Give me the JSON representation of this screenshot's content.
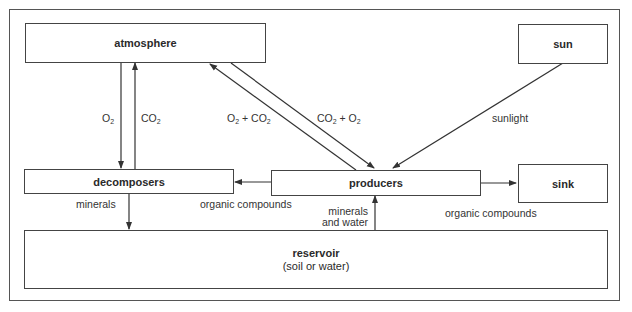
{
  "nodes": {
    "atmosphere": {
      "label": "atmosphere"
    },
    "sun": {
      "label": "sun"
    },
    "decomposers": {
      "label": "decomposers"
    },
    "producers": {
      "label": "producers"
    },
    "sink": {
      "label": "sink"
    },
    "reservoir": {
      "label": "reservoir",
      "sublabel": "(soil or water)"
    }
  },
  "edges": [
    {
      "from": "atmosphere",
      "to": "decomposers",
      "label_main": "O",
      "label_sub": "2"
    },
    {
      "from": "decomposers",
      "to": "atmosphere",
      "label_main": "CO",
      "label_sub": "2"
    },
    {
      "from": "producers",
      "to": "atmosphere",
      "label": "O2 + CO2"
    },
    {
      "from": "atmosphere",
      "to": "producers",
      "label": "CO2 + O2"
    },
    {
      "from": "sun",
      "to": "producers",
      "label": "sunlight"
    },
    {
      "from": "producers",
      "to": "decomposers",
      "label": "organic compounds"
    },
    {
      "from": "producers",
      "to": "sink",
      "label": "organic compounds"
    },
    {
      "from": "decomposers",
      "to": "reservoir",
      "label": "minerals"
    },
    {
      "from": "reservoir",
      "to": "producers",
      "label_line1": "minerals",
      "label_line2": "and water"
    }
  ],
  "labels": {
    "o2": {
      "a": "O",
      "b": "2"
    },
    "co2": {
      "a": "CO",
      "b": "2"
    },
    "o2_co2": {
      "a": "O",
      "b": "2",
      "c": " + CO",
      "d": "2"
    },
    "co2_o2": {
      "a": "CO",
      "b": "2",
      "c": " + O",
      "d": "2"
    },
    "sunlight": "sunlight",
    "organic_left": "organic compounds",
    "organic_right": "organic compounds",
    "minerals": "minerals",
    "minerals_water_1": "minerals",
    "minerals_water_2": "and water"
  }
}
